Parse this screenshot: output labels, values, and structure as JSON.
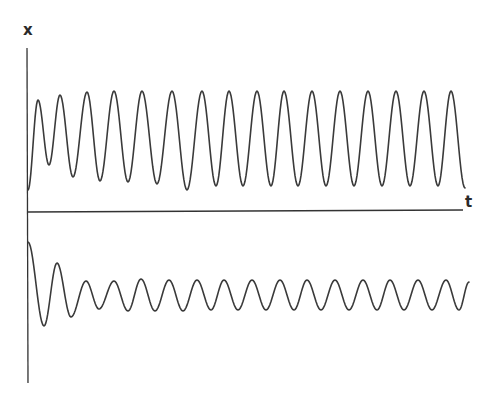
{
  "chart_data": {
    "type": "line",
    "title": "",
    "xlabel": "t",
    "ylabel": "x",
    "grid": false,
    "legend": null,
    "axis_color": "#333333",
    "line_color": "#3a3a3a",
    "series": [
      {
        "name": "upper trace (x > 0, sustained oscillation)",
        "description": "Starts near the t-axis, first peak slightly lower, then settles into steady large-amplitude periodic oscillation",
        "peak_count": 16,
        "peaks_t": [
          38,
          60,
          87,
          114,
          142,
          172,
          202,
          229,
          257,
          284,
          312,
          340,
          368,
          396,
          424,
          451
        ],
        "peaks_y": [
          100,
          95,
          92,
          91,
          91,
          91,
          91,
          91,
          91,
          91,
          91,
          91,
          91,
          91,
          91,
          91
        ],
        "troughs_t": [
          49,
          73,
          100,
          128,
          157,
          187,
          216,
          243,
          271,
          298,
          326,
          354,
          382,
          410,
          438
        ],
        "troughs_y": [
          165,
          177,
          181,
          182,
          184,
          190,
          186,
          186,
          186,
          186,
          186,
          186,
          186,
          186,
          186
        ],
        "start": [
          28,
          190
        ],
        "end": [
          465,
          188
        ]
      },
      {
        "name": "lower trace (x < 0, damped then small steady oscillation)",
        "description": "Starts just below the t-axis, large initial dip, decays to small-amplitude steady oscillation",
        "peak_count": 15,
        "peaks_t": [
          57,
          86,
          114,
          141,
          169,
          197,
          224,
          252,
          280,
          307,
          335,
          363,
          390,
          418,
          446
        ],
        "peaks_y": [
          263,
          281,
          281,
          279,
          280,
          280,
          280,
          280,
          280,
          280,
          280,
          280,
          280,
          280,
          280
        ],
        "troughs_t": [
          44,
          71,
          99,
          128,
          155,
          183,
          211,
          238,
          266,
          294,
          321,
          349,
          377,
          404,
          432,
          459
        ],
        "troughs_y": [
          326,
          317,
          309,
          311,
          311,
          311,
          310,
          310,
          310,
          310,
          310,
          310,
          310,
          310,
          310,
          310
        ],
        "start": [
          28,
          242
        ],
        "end": [
          469,
          282
        ]
      }
    ],
    "axes": {
      "y_axis": {
        "x": 27,
        "y_top": 48,
        "y_bottom": 383
      },
      "t_axis": {
        "y": 211,
        "x_left": 27,
        "x_right": 463
      }
    }
  },
  "labels": {
    "y_axis": "x",
    "x_axis": "t"
  }
}
